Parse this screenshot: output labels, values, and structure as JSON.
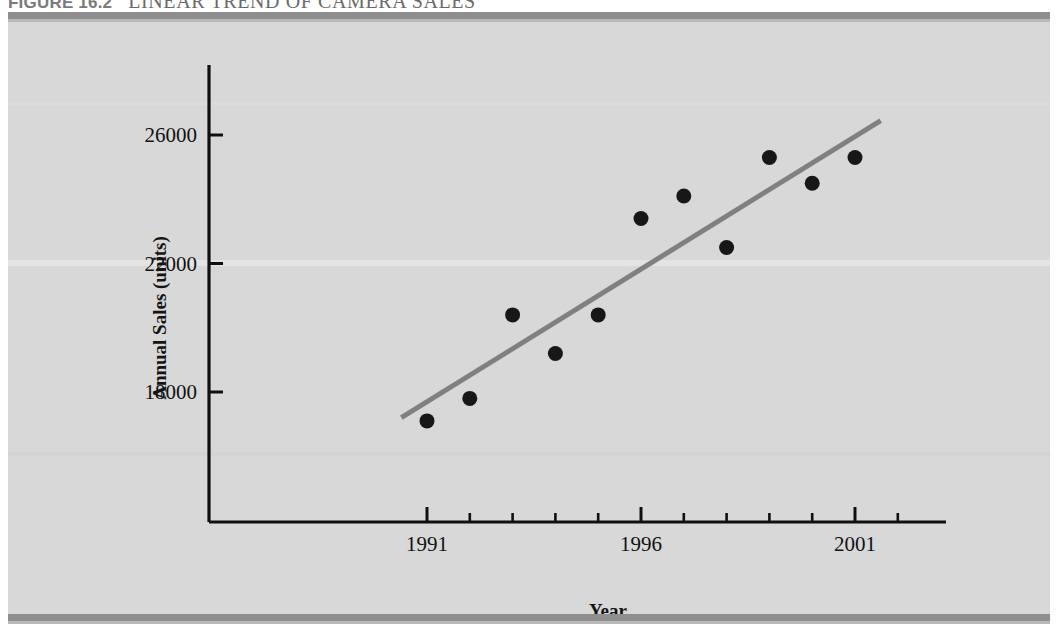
{
  "figure": {
    "number_label": "FIGURE 16.2",
    "title": "LINEAR TREND OF CAMERA SALES"
  },
  "colors": {
    "panel_background": "#d8d8d8",
    "rule": "#8e8e8e",
    "axis": "#101010",
    "point": "#171717",
    "trend_line": "#808080",
    "caption_text": "#6d6d6d"
  },
  "chart_data": {
    "type": "scatter",
    "title": "LINEAR TREND OF CAMERA SALES",
    "xlabel": "Year",
    "ylabel": "Annual Sales (units)",
    "xlim": [
      1988,
      2002
    ],
    "ylim": [
      14000,
      28000
    ],
    "grid": false,
    "legend": "none",
    "x_ticks_major": [
      1991,
      1996,
      2001
    ],
    "x_tick_labels": [
      "1991",
      "1996",
      "2001"
    ],
    "x_ticks_minor": [
      1992,
      1993,
      1994,
      1995,
      1997,
      1998,
      1999,
      2000,
      2002
    ],
    "y_ticks": [
      18000,
      22000,
      26000
    ],
    "y_tick_labels": [
      "18000",
      "22000",
      "26000"
    ],
    "x": [
      1991,
      1992,
      1993,
      1994,
      1995,
      1996,
      1997,
      1998,
      1999,
      2000,
      2001
    ],
    "values": [
      17100,
      17800,
      20400,
      19200,
      20400,
      23400,
      24100,
      22500,
      25300,
      24500,
      25300
    ],
    "series": [
      {
        "name": "Annual Sales",
        "values": [
          17100,
          17800,
          20400,
          19200,
          20400,
          23400,
          24100,
          22500,
          25300,
          24500,
          25300
        ]
      }
    ],
    "trend": {
      "name": "Linear trend",
      "x_start": 1990.4,
      "y_start": 17200,
      "x_end": 2001.6,
      "y_end": 26450
    },
    "annotations": []
  }
}
